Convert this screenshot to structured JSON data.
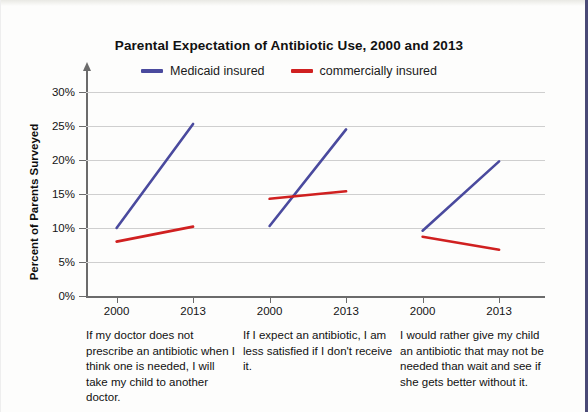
{
  "chart_data": {
    "type": "line",
    "title": "Parental Expectation of Antibiotic Use, 2000 and 2013",
    "xlabel": "",
    "ylabel": "Percent of Parents Surveyed",
    "ylim": [
      0,
      30
    ],
    "ytick_labels": [
      "30%",
      "25%",
      "20%",
      "15%",
      "10%",
      "5%",
      "0%"
    ],
    "ytick_values": [
      30,
      25,
      20,
      15,
      10,
      5,
      0
    ],
    "grid": true,
    "legend_position": "top-center",
    "x": [
      "2000",
      "2013"
    ],
    "panels": [
      {
        "caption": "If my doctor does not prescribe an antibiotic when I think one is needed, I will take my child to another doctor.",
        "xtick_labels": [
          "2000",
          "2013"
        ],
        "series": [
          {
            "name": "Medicaid insured",
            "values": [
              10.0,
              25.3
            ]
          },
          {
            "name": "commercially insured",
            "values": [
              8.0,
              10.2
            ]
          }
        ]
      },
      {
        "caption": "If I expect an antibiotic, I am less satisfied if I don't receive it.",
        "xtick_labels": [
          "2000",
          "2013"
        ],
        "series": [
          {
            "name": "Medicaid insured",
            "values": [
              10.3,
              24.5
            ]
          },
          {
            "name": "commercially insured",
            "values": [
              14.3,
              15.4
            ]
          }
        ]
      },
      {
        "caption": "I would rather give my child an antibiotic that may not be needed than wait and see if she gets better without it.",
        "xtick_labels": [
          "2000",
          "2013"
        ],
        "series": [
          {
            "name": "Medicaid insured",
            "values": [
              9.6,
              19.8
            ]
          },
          {
            "name": "commercially insured",
            "values": [
              8.7,
              6.8
            ]
          }
        ]
      }
    ],
    "legend": [
      {
        "label": "Medicaid insured",
        "color": "#4a4a9e"
      },
      {
        "label": "commercially insured",
        "color": "#d02020"
      }
    ]
  }
}
